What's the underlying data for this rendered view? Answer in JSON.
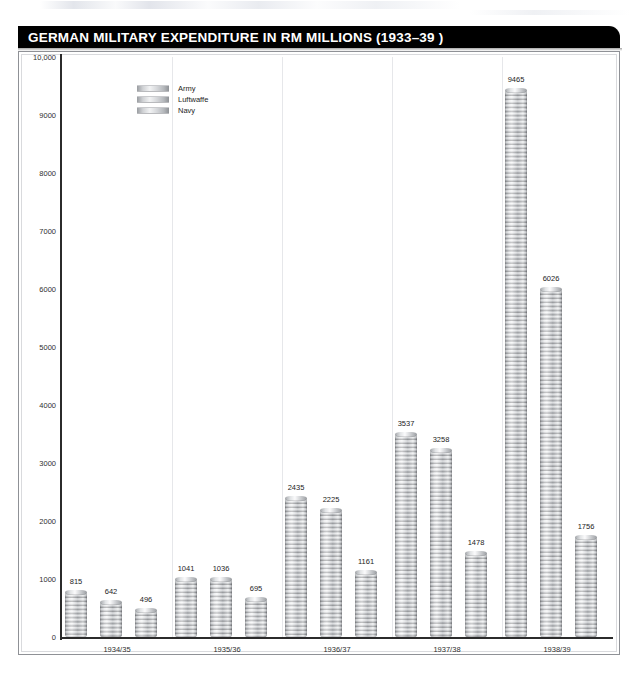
{
  "header": {
    "title": "GERMAN MILITARY EXPENDITURE IN RM MILLIONS (1933–39 )"
  },
  "legend": {
    "position": "top-left-inside",
    "items": [
      {
        "label": "Army",
        "key": "army"
      },
      {
        "label": "Luftwaffe",
        "key": "luftwaffe"
      },
      {
        "label": "Navy",
        "key": "navy"
      }
    ]
  },
  "axes": {
    "y_ticks": [
      "10,000",
      "9000",
      "8000",
      "7000",
      "6000",
      "5000",
      "4000",
      "3000",
      "2000",
      "1000",
      "0"
    ],
    "y_tick_values": [
      10000,
      9000,
      8000,
      7000,
      6000,
      5000,
      4000,
      3000,
      2000,
      1000,
      0
    ],
    "x_ticks": [
      "1934/35",
      "1935/36",
      "1936/37",
      "1937/38",
      "1938/39"
    ]
  },
  "colors": {
    "title_bar_bg": "#000000",
    "title_bar_text": "#ffffff",
    "frame_border": "#8f9196",
    "gridline": "#e6e7ea",
    "axis_line": "#2b2b2b",
    "bar_light": "#f7f8f9",
    "bar_mid": "#babdc1",
    "bar_dark": "#7e8185",
    "label_text": "#232323",
    "page_bg": "#ffffff"
  },
  "chart_data": {
    "type": "bar",
    "title": "GERMAN MILITARY EXPENDITURE IN RM MILLIONS (1933–39 )",
    "xlabel": "",
    "ylabel": "",
    "ylim": [
      0,
      10000
    ],
    "grid": "vertical-group-separators",
    "legend_position": "upper left (inside plot)",
    "categories": [
      "1934/35",
      "1935/36",
      "1936/37",
      "1937/38",
      "1938/39"
    ],
    "series": [
      {
        "name": "Army",
        "values": [
          815,
          1041,
          2435,
          3537,
          9465
        ]
      },
      {
        "name": "Luftwaffe",
        "values": [
          642,
          1036,
          2225,
          3258,
          6026
        ]
      },
      {
        "name": "Navy",
        "values": [
          496,
          695,
          1161,
          1478,
          1756
        ]
      }
    ],
    "data_labels": [
      [
        "815",
        "642",
        "496"
      ],
      [
        "1041",
        "1036",
        "695"
      ],
      [
        "2435",
        "2225",
        "1161"
      ],
      [
        "3537",
        "3258",
        "1478"
      ],
      [
        "9465",
        "6026",
        "1756"
      ]
    ]
  }
}
